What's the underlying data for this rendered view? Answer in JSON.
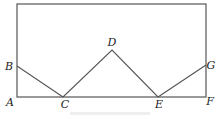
{
  "diagram": {
    "type": "geometry",
    "rectangle": {
      "x1": 17,
      "y1": 4,
      "x2": 206,
      "y2": 97
    },
    "stroke_color": "#555555",
    "points": {
      "A": {
        "x": 17,
        "y": 97,
        "label": "A",
        "lx": 13,
        "ly": 105
      },
      "B": {
        "x": 17,
        "y": 66,
        "label": "B",
        "lx": 10,
        "ly": 68
      },
      "C": {
        "x": 63,
        "y": 97,
        "label": "C",
        "lx": 65,
        "ly": 107
      },
      "D": {
        "x": 112,
        "y": 50,
        "label": "D",
        "lx": 112,
        "ly": 45
      },
      "E": {
        "x": 158,
        "y": 97,
        "label": "E",
        "lx": 159,
        "ly": 107
      },
      "F": {
        "x": 206,
        "y": 97,
        "label": "F",
        "lx": 210,
        "ly": 104
      },
      "G": {
        "x": 206,
        "y": 65,
        "label": "G",
        "lx": 211,
        "ly": 67
      }
    },
    "segments": [
      [
        "B",
        "C"
      ],
      [
        "C",
        "D"
      ],
      [
        "D",
        "E"
      ],
      [
        "E",
        "G"
      ],
      [
        "A",
        "F"
      ]
    ],
    "caption": "(faint, illegible)"
  }
}
